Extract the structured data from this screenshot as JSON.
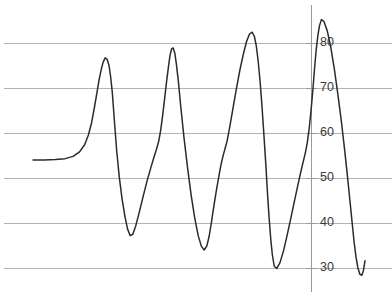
{
  "chart_data": {
    "type": "line",
    "title": "",
    "subtitle": "",
    "xlabel": "",
    "ylabel": "",
    "legend": [],
    "grid": true,
    "grid_orientation": "horizontal",
    "legend_position": "none",
    "axis_position": "right",
    "xlim": [
      0,
      100
    ],
    "ylim": [
      26.5,
      87
    ],
    "xaxis_visible": false,
    "xticks": [],
    "xticklabels": [],
    "yticks": [
      30,
      40,
      50,
      60,
      70,
      80
    ],
    "yticklabels": [
      "30",
      "40",
      "50",
      "60",
      "70",
      "80"
    ],
    "series": [
      {
        "name": "signal",
        "color": "#2b2b2b",
        "linewidth": 1.5,
        "x": [
          4.5,
          8.0,
          11.5,
          14.5,
          17.0,
          19.0,
          20.6,
          21.8,
          22.8,
          23.6,
          24.4,
          25.1,
          25.8,
          26.4,
          27.0,
          27.6,
          28.2,
          28.7,
          29.2,
          29.6,
          30.0,
          30.6,
          31.4,
          32.3,
          33.2,
          34.0,
          34.8,
          35.6,
          36.5,
          37.6,
          38.8,
          40.0,
          41.2,
          42.2,
          43.0,
          43.7,
          44.3,
          44.9,
          45.5,
          46.1,
          46.7,
          47.2,
          47.7,
          48.2,
          48.7,
          49.2,
          49.8,
          50.6,
          51.6,
          52.7,
          53.8,
          54.9,
          56.0,
          57.0,
          57.9,
          58.7,
          59.4,
          60.0,
          60.6,
          61.2,
          61.8,
          62.4,
          62.9,
          63.4,
          63.9,
          64.4,
          65.0,
          65.8,
          66.8,
          67.9,
          69.0,
          70.1,
          71.1,
          72.0,
          72.8,
          73.5,
          74.1,
          74.7,
          75.3,
          75.9,
          76.5,
          77.1,
          77.6,
          78.1,
          78.6,
          79.1,
          79.7,
          80.5,
          81.5,
          82.6,
          83.7,
          84.8,
          85.8,
          86.7,
          87.5,
          88.2,
          88.8,
          89.4,
          90.0,
          90.6,
          91.2,
          91.8,
          92.3,
          92.8,
          93.3,
          93.8,
          94.4,
          95.2,
          96.2,
          97.3,
          98.4,
          99.5,
          100.6,
          101.6,
          102.5,
          103.3,
          104.0,
          104.6,
          105.2,
          105.8,
          106.4,
          107.0,
          107.5,
          108.0
        ],
        "y": [
          54.0,
          54.0,
          54.1,
          54.3,
          54.8,
          55.8,
          57.4,
          59.6,
          62.4,
          65.5,
          68.8,
          71.8,
          74.2,
          75.8,
          76.7,
          76.4,
          75.0,
          72.5,
          69.2,
          65.4,
          61.5,
          56.0,
          50.2,
          45.2,
          41.3,
          38.6,
          37.2,
          37.5,
          39.3,
          42.3,
          45.8,
          49.2,
          52.2,
          54.6,
          56.4,
          58.2,
          60.6,
          63.8,
          67.4,
          71.2,
          74.6,
          77.2,
          78.7,
          78.9,
          77.8,
          75.3,
          71.6,
          65.6,
          58.8,
          52.2,
          46.2,
          41.2,
          37.2,
          34.8,
          34.0,
          34.9,
          37.0,
          39.6,
          42.4,
          45.2,
          47.8,
          50.2,
          52.2,
          53.9,
          55.3,
          56.6,
          58.2,
          61.2,
          65.3,
          69.8,
          74.0,
          77.6,
          80.4,
          82.0,
          82.4,
          81.5,
          79.4,
          76.0,
          71.4,
          65.8,
          59.4,
          52.8,
          46.6,
          41.2,
          36.6,
          33.0,
          30.4,
          29.9,
          31.2,
          33.8,
          37.2,
          40.8,
          44.2,
          47.2,
          49.8,
          52.0,
          53.8,
          55.6,
          57.8,
          61.0,
          65.2,
          70.0,
          74.6,
          78.6,
          81.6,
          83.8,
          85.2,
          84.8,
          82.8,
          79.2,
          74.4,
          68.8,
          62.8,
          56.6,
          50.6,
          45.0,
          40.0,
          35.8,
          32.4,
          30.0,
          28.6,
          28.4,
          29.4,
          31.6
        ]
      }
    ],
    "series_continued": {
      "note": "full curve sampled as one polyline",
      "peaks": [
        76.7,
        78.9,
        82.4,
        85.2,
        82.9,
        76.7
      ],
      "troughs": [
        37.2,
        34.0,
        29.9,
        28.4,
        29.9,
        35.5
      ],
      "baseline_start": 54.0,
      "baseline_end": 54.6,
      "cycle_count": 6
    }
  },
  "colors": {
    "background": "#ffffff",
    "curve": "#2b2b2b",
    "gridline": "#b3b3b3",
    "axis": "#9a9a9a",
    "tick_text": "#3a3a3a"
  }
}
